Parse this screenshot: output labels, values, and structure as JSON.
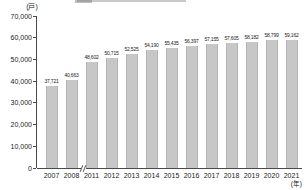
{
  "y_unit_label": "(戸)",
  "x_unit_label": "(年)",
  "chart_data": {
    "type": "bar",
    "title": "",
    "categories": [
      "2007",
      "2008",
      "2011",
      "2012",
      "2013",
      "2014",
      "2015",
      "2016",
      "2017",
      "2018",
      "2019",
      "2020",
      "2021"
    ],
    "values": [
      37721,
      40663,
      48602,
      50715,
      52525,
      54190,
      55435,
      56397,
      57155,
      57605,
      58182,
      58799,
      59162
    ],
    "value_labels": [
      "37,721",
      "40,663",
      "48,602",
      "50,715",
      "52,525",
      "54,190",
      "55,435",
      "56,397",
      "57,155",
      "57,605",
      "58,182",
      "58,799",
      "59,162"
    ],
    "xlabel_unit": "(年)",
    "ylabel_unit": "(戸)",
    "ylim": [
      0,
      70000
    ],
    "ytick_step": 10000,
    "ytick_labels": [
      "0",
      "10,000",
      "20,000",
      "30,000",
      "40,000",
      "50,000",
      "60,000",
      "70,000"
    ],
    "x_axis_break_between": [
      "2008",
      "2011"
    ],
    "grid": "off",
    "legend": "none",
    "bar_color": "#c7c7c7",
    "axis_color": "#4a4a4a",
    "text_color": "#222222"
  }
}
